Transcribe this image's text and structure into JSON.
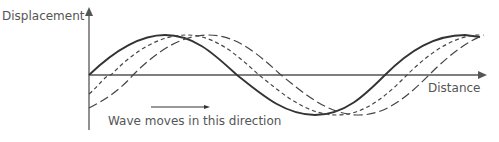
{
  "diagram": {
    "y_axis_label": "Displacement",
    "x_axis_label": "Distance",
    "annotation": "Wave moves in this direction",
    "colors": {
      "axis": "#555555",
      "wave": "#333333",
      "text": "#555555"
    },
    "waves": [
      {
        "name": "wave-solid",
        "style": "solid",
        "phase_shift_px": 0
      },
      {
        "name": "wave-short-dash",
        "style": "short-dash",
        "phase_shift_px": 22
      },
      {
        "name": "wave-long-dash",
        "style": "long-dash",
        "phase_shift_px": 44
      }
    ]
  }
}
